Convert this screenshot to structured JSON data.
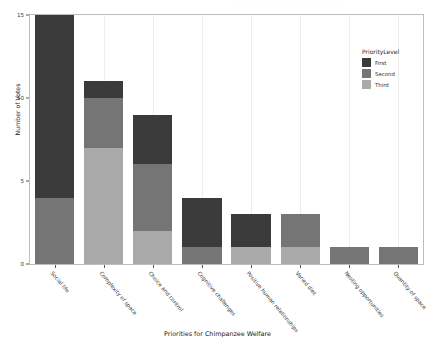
{
  "chart_data": {
    "type": "bar",
    "stacked": true,
    "title": "",
    "xlabel": "Priorities for Chimpanzee Welfare",
    "ylabel": "Number of Votes",
    "ylim": [
      0,
      15
    ],
    "yticks": [
      0,
      5,
      10,
      15
    ],
    "ytick_labels": [
      "0",
      "5",
      "10",
      "15"
    ],
    "grid": true,
    "grid_axis": "x",
    "legend": {
      "title": "PriorityLevel",
      "position": "right",
      "entries": [
        {
          "label": "First",
          "color": "#3b3b3b"
        },
        {
          "label": "Second",
          "color": "#757575"
        },
        {
          "label": "Third",
          "color": "#aaaaaa"
        }
      ]
    },
    "categories": [
      "Social life",
      "Complexity of space",
      "Choice and control",
      "Cognitive challenges",
      "Positive human relationships",
      "Varied diet",
      "Nesting opportunities",
      "Quantity of space"
    ],
    "series": [
      {
        "name": "First",
        "color": "#3b3b3b",
        "values": [
          11,
          1,
          3,
          3,
          2,
          0,
          0,
          0
        ]
      },
      {
        "name": "Second",
        "color": "#757575",
        "values": [
          4,
          3,
          4,
          1,
          0,
          2,
          1,
          1
        ]
      },
      {
        "name": "Third",
        "color": "#aaaaaa",
        "values": [
          0,
          7,
          2,
          0,
          1,
          1,
          0,
          0
        ]
      }
    ],
    "totals": [
      15,
      11,
      9,
      4,
      3,
      3,
      1,
      1
    ]
  },
  "artifact": {
    "top_strip_text": "· · ·· · ·· · ·· · · ·· ·· · · ·"
  }
}
